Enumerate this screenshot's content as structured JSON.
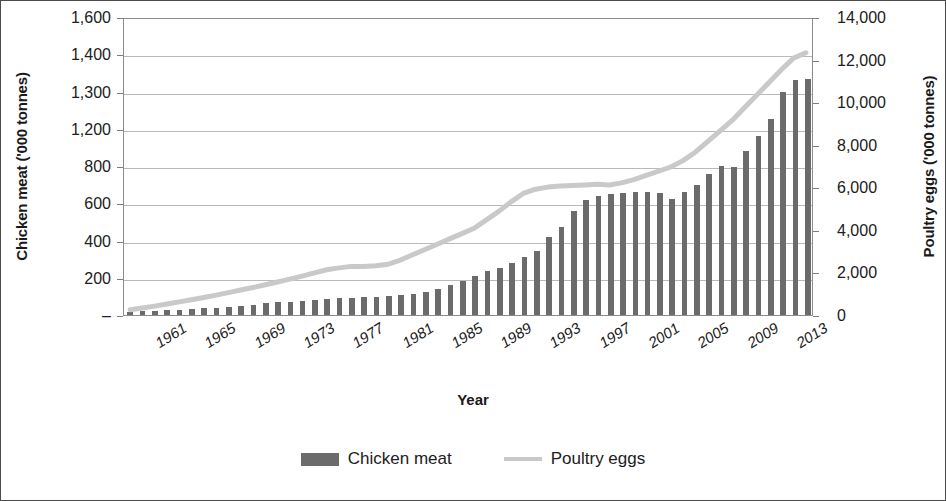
{
  "chart_data": {
    "type": "bar",
    "title": "",
    "xlabel": "Year",
    "ylabel": "Chicken meat ('000 tonnes)",
    "y2label": "Poultry eggs ('000 tonnes)",
    "grid": true,
    "legend_position": "bottom-center",
    "colors": {
      "chicken_meat_bar": "#6b6b6b",
      "poultry_eggs_line": "#c9c9c9",
      "gridline": "#b9b9b9",
      "plot_border": "#8c8c8c",
      "figure_border": "#4a4a4a",
      "text": "#202020"
    },
    "x_axis": {
      "label": "Year",
      "tick_labels": [
        "1961",
        "1965",
        "1969",
        "1973",
        "1977",
        "1981",
        "1985",
        "1989",
        "1993",
        "1997",
        "2001",
        "2005",
        "2009",
        "2013"
      ],
      "tick_interval_years": 4,
      "first_year": 1961,
      "last_year": 2016,
      "rotation_degrees": -32,
      "italic": true
    },
    "y_axis_left": {
      "label": "Chicken meat ('000 tonnes)",
      "tick_labels": [
        "1,600",
        "1,400",
        "1,300",
        "1,200",
        "800",
        "600",
        "400",
        "200",
        "–"
      ],
      "ylim": [
        0,
        1600
      ],
      "note_gridlines_evenly_spaced": true
    },
    "y_axis_right": {
      "label": "Poultry eggs ('000 tonnes)",
      "tick_labels": [
        "14,000",
        "12,000",
        "10,000",
        "8,000",
        "6,000",
        "4,000",
        "2,000",
        "0"
      ],
      "ylim": [
        0,
        14000
      ],
      "tick_step": 2000
    },
    "categories": [
      1961,
      1962,
      1963,
      1964,
      1965,
      1966,
      1967,
      1968,
      1969,
      1970,
      1971,
      1972,
      1973,
      1974,
      1975,
      1976,
      1977,
      1978,
      1979,
      1980,
      1981,
      1982,
      1983,
      1984,
      1985,
      1986,
      1987,
      1988,
      1989,
      1990,
      1991,
      1992,
      1993,
      1994,
      1995,
      1996,
      1997,
      1998,
      1999,
      2000,
      2001,
      2002,
      2003,
      2004,
      2005,
      2006,
      2007,
      2008,
      2009,
      2010,
      2011,
      2012,
      2013,
      2014,
      2015,
      2016
    ],
    "series": [
      {
        "name": "Chicken meat",
        "type": "bar",
        "axis": "left",
        "unit": "'000 tonnes",
        "color": "#6b6b6b",
        "values": [
          18,
          20,
          22,
          25,
          28,
          32,
          36,
          40,
          45,
          50,
          56,
          62,
          68,
          72,
          76,
          80,
          86,
          90,
          92,
          95,
          98,
          100,
          108,
          115,
          125,
          140,
          160,
          185,
          210,
          235,
          250,
          280,
          310,
          345,
          420,
          470,
          560,
          620,
          640,
          650,
          655,
          660,
          660,
          655,
          625,
          660,
          700,
          755,
          800,
          795,
          880,
          960,
          1050,
          1200,
          1260,
          1265
        ]
      },
      {
        "name": "Poultry eggs",
        "type": "line",
        "axis": "right",
        "unit": "'000 tonnes",
        "color": "#c9c9c9",
        "values": [
          250,
          330,
          420,
          520,
          620,
          720,
          830,
          940,
          1060,
          1180,
          1300,
          1430,
          1560,
          1700,
          1840,
          1990,
          2140,
          2230,
          2300,
          2290,
          2330,
          2400,
          2600,
          2850,
          3100,
          3350,
          3600,
          3850,
          4100,
          4500,
          4900,
          5350,
          5750,
          5950,
          6050,
          6100,
          6130,
          6150,
          6180,
          6150,
          6250,
          6400,
          6600,
          6800,
          7000,
          7300,
          7700,
          8200,
          8700,
          9200,
          9800,
          10400,
          11000,
          11600,
          12150,
          12400
        ]
      }
    ],
    "legend": [
      {
        "label": "Chicken meat",
        "marker": "bar-swatch"
      },
      {
        "label": "Poultry eggs",
        "marker": "line-swatch"
      }
    ]
  }
}
